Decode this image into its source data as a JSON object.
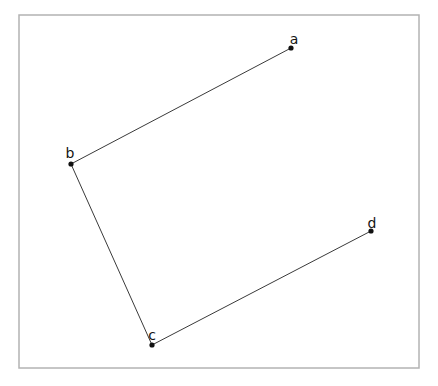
{
  "figure": {
    "type": "point-and-line-diagram",
    "width": 438,
    "height": 386,
    "background_color": "#ffffff",
    "frame": {
      "name": "plot-border",
      "x": 19,
      "y": 15,
      "width": 400,
      "height": 353,
      "stroke_color": "#b3b3b3",
      "stroke_width": 1.5,
      "fill": "none"
    },
    "style": {
      "line_color": "#3a3a3a",
      "line_width": 1,
      "dot_color": "#111111",
      "dot_radius": 2.6,
      "label_color": "#141414",
      "label_font_size": 14
    },
    "points": [
      {
        "id": "a",
        "label": "a",
        "x": 291,
        "y": 48,
        "label_x": 294,
        "label_y": 44
      },
      {
        "id": "b",
        "label": "b",
        "x": 71,
        "y": 164,
        "label_x": 70,
        "label_y": 158
      },
      {
        "id": "c",
        "label": "c",
        "x": 152,
        "y": 345,
        "label_x": 152,
        "label_y": 340
      },
      {
        "id": "d",
        "label": "d",
        "x": 371,
        "y": 231,
        "label_x": 372,
        "label_y": 228
      }
    ],
    "segments": [
      {
        "id": "segment-ab",
        "from": "a",
        "to": "b"
      },
      {
        "id": "segment-bc",
        "from": "b",
        "to": "c"
      },
      {
        "id": "segment-cd",
        "from": "c",
        "to": "d"
      }
    ]
  }
}
